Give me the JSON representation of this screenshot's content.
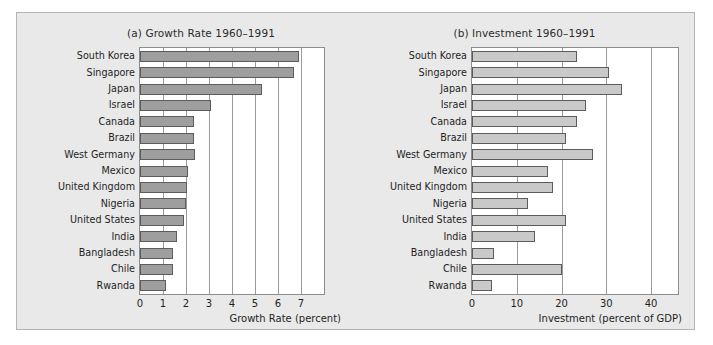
{
  "chart_data": [
    {
      "type": "bar",
      "orientation": "horizontal",
      "panel": "(a)",
      "title": "(a) Growth Rate 1960–1991",
      "xlabel": "Growth Rate (percent)",
      "ylabel": "",
      "xlim": [
        0,
        8
      ],
      "xticks": [
        0,
        1,
        2,
        3,
        4,
        5,
        6,
        7
      ],
      "xtick_labels": [
        "0",
        "1",
        "2",
        "3",
        "4",
        "5",
        "6",
        "7"
      ],
      "grid": true,
      "legend": "none",
      "bar_color": "#9e9e9e",
      "bar_edge_color": "#5c5c5c",
      "categories": [
        "South Korea",
        "Singapore",
        "Japan",
        "Israel",
        "Canada",
        "Brazil",
        "West Germany",
        "Mexico",
        "United Kingdom",
        "Nigeria",
        "United States",
        "India",
        "Bangladesh",
        "Chile",
        "Rwanda"
      ],
      "values": [
        6.9,
        6.7,
        5.3,
        3.1,
        2.35,
        2.35,
        2.4,
        2.1,
        2.05,
        2.0,
        1.9,
        1.6,
        1.45,
        1.45,
        1.15
      ]
    },
    {
      "type": "bar",
      "orientation": "horizontal",
      "panel": "(b)",
      "title": "(b) Investment 1960–1991",
      "xlabel": "Investment (percent of GDP)",
      "ylabel": "",
      "xlim": [
        0,
        46
      ],
      "xticks": [
        0,
        10,
        20,
        30,
        40
      ],
      "xtick_labels": [
        "0",
        "10",
        "20",
        "30",
        "40"
      ],
      "grid": true,
      "legend": "none",
      "bar_color": "#c9c9c9",
      "bar_edge_color": "#5c5c5c",
      "categories": [
        "South Korea",
        "Singapore",
        "Japan",
        "Israel",
        "Canada",
        "Brazil",
        "West Germany",
        "Mexico",
        "United Kingdom",
        "Nigeria",
        "United States",
        "India",
        "Bangladesh",
        "Chile",
        "Rwanda"
      ],
      "values": [
        23.5,
        30.5,
        33.5,
        25.5,
        23.5,
        21.0,
        27.0,
        17.0,
        18.0,
        12.5,
        21.0,
        14.0,
        5.0,
        20.0,
        4.5
      ]
    }
  ],
  "figure": {
    "background": "#e9e9e9",
    "plot_background": "#ffffff"
  }
}
